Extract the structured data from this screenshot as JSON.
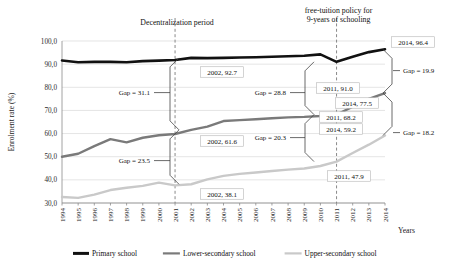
{
  "chart_data": {
    "type": "line",
    "title": "",
    "xlabel": "Years",
    "ylabel": "Enrolment rate (%)",
    "ylim": [
      30.0,
      100.0
    ],
    "yticks": [
      "30,0",
      "40,0",
      "50,0",
      "60,0",
      "70,0",
      "80,0",
      "90,0",
      "100,0"
    ],
    "ytick_values": [
      30,
      40,
      50,
      60,
      70,
      80,
      90,
      100
    ],
    "grid": true,
    "legend_position": "bottom",
    "categories": [
      "1994",
      "1995",
      "1996",
      "1997",
      "1998",
      "1999",
      "2000",
      "2001",
      "2002",
      "2003",
      "2004",
      "2005",
      "2006",
      "2007",
      "2008",
      "2009",
      "2010",
      "2011",
      "2012",
      "2013",
      "2014"
    ],
    "series": [
      {
        "name": "Primary school",
        "color": "#111111",
        "width": 2.6,
        "values": [
          91.6,
          90.8,
          91.0,
          91.0,
          90.8,
          91.3,
          91.5,
          91.8,
          92.7,
          92.6,
          92.7,
          92.9,
          93.0,
          93.2,
          93.4,
          93.6,
          94.2,
          91.0,
          93.2,
          95.2,
          96.4
        ]
      },
      {
        "name": "Lower-secondary school",
        "color": "#7a7a7a",
        "width": 2.4,
        "values": [
          50.0,
          51.3,
          54.6,
          57.6,
          56.2,
          58.2,
          59.3,
          59.8,
          61.6,
          63.0,
          65.4,
          65.8,
          66.2,
          66.6,
          67.0,
          67.2,
          67.6,
          68.2,
          71.6,
          75.0,
          77.5
        ]
      },
      {
        "name": "Upper-secondary school",
        "color": "#c9c9c9",
        "width": 2.4,
        "values": [
          32.6,
          32.2,
          33.6,
          35.6,
          36.6,
          37.4,
          38.8,
          37.6,
          38.1,
          40.2,
          41.7,
          42.6,
          43.2,
          43.8,
          44.4,
          44.9,
          46.0,
          47.9,
          51.6,
          55.2,
          59.2
        ]
      }
    ],
    "annotations": {
      "event_lines": [
        {
          "id": "decentralization",
          "year": "2001",
          "label": "Decentralization period"
        },
        {
          "id": "free-tuition",
          "year": "2011",
          "label": "free-tuition policy for\n9-years of schooling"
        }
      ],
      "event_label_1": "Decentralization period",
      "event_label_2_line1": "free-tuition policy for",
      "event_label_2_line2": "9-years of schooling",
      "point_labels": [
        {
          "id": "primary-2002",
          "text": "2002, 92.7"
        },
        {
          "id": "primary-2011",
          "text": "2011, 91.0"
        },
        {
          "id": "primary-2014",
          "text": "2014, 96.4"
        },
        {
          "id": "lower-2002",
          "text": "2002, 61.6"
        },
        {
          "id": "lower-2011",
          "text": "2011, 68.2"
        },
        {
          "id": "lower-2014",
          "text": "2014, 77.5"
        },
        {
          "id": "upper-2002",
          "text": "2002, 38.1"
        },
        {
          "id": "upper-2011",
          "text": "2011, 47.9"
        },
        {
          "id": "upper-2014",
          "text": "2014, 59.2"
        }
      ],
      "gap_labels": [
        {
          "id": "gap-2002-primary-lower",
          "text": "Gap = 31.1",
          "value": 31.1
        },
        {
          "id": "gap-2002-lower-upper",
          "text": "Gap = 23.5",
          "value": 23.5
        },
        {
          "id": "gap-2011-primary-lower",
          "text": "Gap = 28.8",
          "value": 28.8
        },
        {
          "id": "gap-2011-lower-upper",
          "text": "Gap = 20.3",
          "value": 20.3
        },
        {
          "id": "gap-2014-primary-lower",
          "text": "Gap = 19.9",
          "value": 19.9
        },
        {
          "id": "gap-2014-lower-upper",
          "text": "Gap = 18.2",
          "value": 18.2
        }
      ]
    },
    "legend": [
      {
        "label": "Primary school",
        "color": "#111111"
      },
      {
        "label": "Lower-secondary school",
        "color": "#7a7a7a"
      },
      {
        "label": "Upper-secondary school",
        "color": "#c9c9c9"
      }
    ]
  }
}
